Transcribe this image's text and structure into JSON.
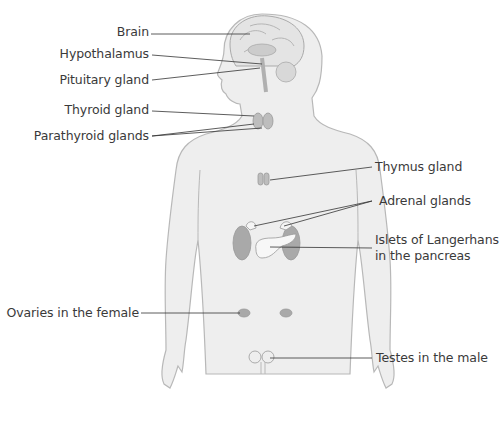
{
  "diagram": {
    "colors": {
      "body_fill": "#eeeeee",
      "body_outline": "#b8b8b8",
      "gland_fill": "#a9a9a9",
      "leader_line": "#333333",
      "label_text": "#3a3a3a"
    },
    "labels": [
      {
        "id": "brain",
        "text": "Brain",
        "side": "left"
      },
      {
        "id": "hypothalamus",
        "text": "Hypothalamus",
        "side": "left"
      },
      {
        "id": "pituitary",
        "text": "Pituitary gland",
        "side": "left"
      },
      {
        "id": "thyroid",
        "text": "Thyroid gland",
        "side": "left"
      },
      {
        "id": "parathyroid",
        "text": "Parathyroid glands",
        "side": "left"
      },
      {
        "id": "thymus",
        "text": "Thymus gland",
        "side": "right"
      },
      {
        "id": "adrenal",
        "text": "Adrenal glands",
        "side": "right"
      },
      {
        "id": "islets",
        "text": "Islets of Langerhans",
        "text2": "in the pancreas",
        "side": "right"
      },
      {
        "id": "ovaries",
        "text": "Ovaries in the female",
        "side": "left"
      },
      {
        "id": "testes",
        "text": "Testes in the male",
        "side": "right"
      }
    ]
  }
}
